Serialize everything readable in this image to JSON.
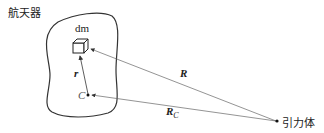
{
  "diagram": {
    "spacecraft_label": "航天器",
    "mass_element_label": "dm",
    "position_vector_label": "r",
    "center_label": "C",
    "distance_vector_label": "R",
    "center_distance_label": "R",
    "center_distance_subscript": "C",
    "attracting_body_label": "引力体",
    "line_color": "#555555",
    "outline_color": "#333333"
  }
}
